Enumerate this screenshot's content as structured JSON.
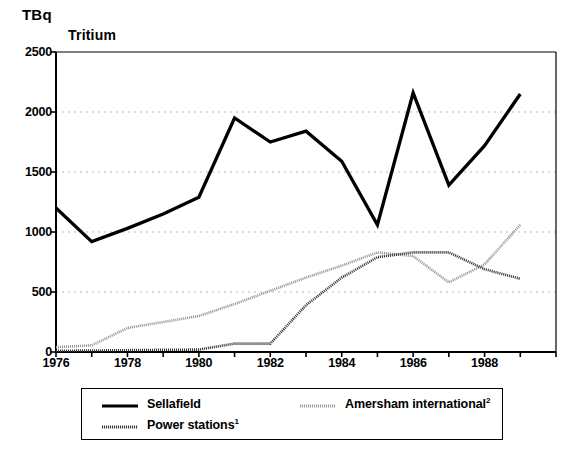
{
  "figure": {
    "unit_label": "TBq",
    "title": "Tritium"
  },
  "chart_data": {
    "type": "line",
    "title": "Tritium",
    "xlabel": "",
    "ylabel": "TBq",
    "ylim": [
      0,
      2500
    ],
    "xlim": [
      1976,
      1990
    ],
    "yticks": [
      0,
      500,
      1000,
      1500,
      2000,
      2500
    ],
    "ytick_labels": [
      "0",
      "500",
      "1000",
      "1500",
      "2000",
      "2500"
    ],
    "xticks": [
      1976,
      1977,
      1978,
      1979,
      1980,
      1981,
      1982,
      1983,
      1984,
      1985,
      1986,
      1987,
      1988,
      1989,
      1990
    ],
    "xtick_labels": [
      "1976",
      "",
      "1978",
      "",
      "1980",
      "",
      "1982",
      "",
      "1984",
      "",
      "1986",
      "",
      "1988",
      "",
      ""
    ],
    "grid": "horizontal-dotted",
    "legend_position": "below-plot",
    "x": [
      1976,
      1977,
      1978,
      1979,
      1980,
      1981,
      1982,
      1983,
      1984,
      1985,
      1986,
      1987,
      1988,
      1989
    ],
    "series": [
      {
        "name": "Sellafield",
        "style": "solid-thick-black",
        "color": "#000000",
        "values": [
          1200,
          920,
          1030,
          1150,
          1290,
          1950,
          1750,
          1840,
          1590,
          1060,
          2160,
          1390,
          1720,
          2150
        ]
      },
      {
        "name": "Power stations",
        "footnote": "1",
        "style": "dotted-dark-grey",
        "color": "#3a3a3a",
        "values": [
          10,
          12,
          15,
          18,
          20,
          70,
          70,
          390,
          620,
          790,
          830,
          830,
          690,
          610
        ]
      },
      {
        "name": "Amersham international",
        "footnote": "2",
        "style": "dotted-light-grey",
        "color": "#999999",
        "values": [
          40,
          55,
          200,
          250,
          300,
          400,
          510,
          620,
          720,
          830,
          800,
          580,
          730,
          1060
        ]
      }
    ]
  },
  "legend": {
    "items": [
      {
        "label": "Sellafield",
        "footnote": ""
      },
      {
        "label": "Power stations",
        "footnote": "1"
      },
      {
        "label": "Amersham international",
        "footnote": "2"
      }
    ]
  }
}
